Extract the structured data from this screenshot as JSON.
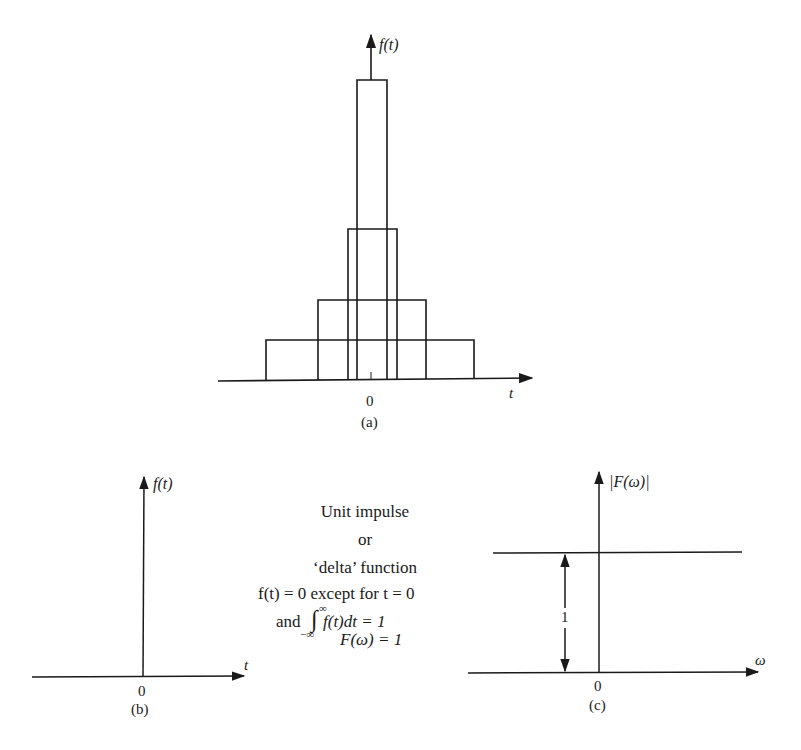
{
  "panel_a": {
    "y_axis_label": "f(t)",
    "x_axis_label": "t",
    "origin_label": "0",
    "caption": "(a)",
    "rectangles": [
      {
        "x0": 266,
        "x1": 474,
        "top": 340
      },
      {
        "x0": 318,
        "x1": 426,
        "top": 300
      },
      {
        "x0": 348,
        "x1": 397,
        "top": 229
      },
      {
        "x0": 357,
        "x1": 387,
        "top": 80
      }
    ]
  },
  "panel_b": {
    "y_axis_label": "f(t)",
    "x_axis_label": "t",
    "origin_label": "0",
    "caption": "(b)"
  },
  "description": {
    "line1": "Unit impulse",
    "line2": "or",
    "line3": "‘delta’ function",
    "line4": "f(t) = 0 except for t = 0",
    "line5_prefix": "and",
    "line5_integral": "∫",
    "line5_upper": "∞",
    "line5_lower": "−∞",
    "line5_body": "f(t)dt = 1",
    "line6": "F(ω) = 1"
  },
  "panel_c": {
    "y_axis_label": "|F(ω)|",
    "x_axis_label": "ω",
    "origin_label": "0",
    "magnitude_label": "1",
    "caption": "(c)"
  }
}
